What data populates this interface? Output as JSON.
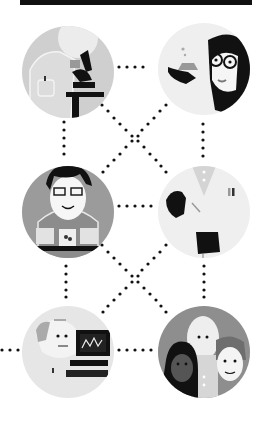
{
  "illustration": {
    "title": "",
    "top_bar_color": "#111111",
    "figures": [
      {
        "id": "scientist-microscope",
        "label": "Scientist with microscope",
        "bg": "#cfcfcf",
        "cx": 68,
        "cy": 72,
        "r": 46
      },
      {
        "id": "scientist-flask",
        "label": "Scientist with goggles holding flask",
        "bg": "#efefef",
        "cx": 204,
        "cy": 69,
        "r": 46
      },
      {
        "id": "researcher-laptops",
        "label": "Researcher with glasses and laptops",
        "bg": "#9b9b9b",
        "cx": 68,
        "cy": 212,
        "r": 46
      },
      {
        "id": "doctor-syringe",
        "label": "Doctor in lab coat with gloves",
        "bg": "#efefef",
        "cx": 204,
        "cy": 212,
        "r": 46
      },
      {
        "id": "elder-computer",
        "label": "Older man with computer monitor",
        "bg": "#e6e6e6",
        "cx": 68,
        "cy": 352,
        "r": 46
      },
      {
        "id": "group-people",
        "label": "Group of three people",
        "bg": "#8e8e8e",
        "cx": 204,
        "cy": 352,
        "r": 46
      }
    ],
    "dot_color": "#111111"
  }
}
